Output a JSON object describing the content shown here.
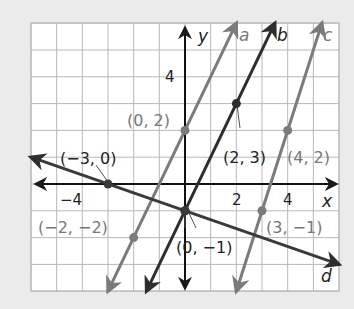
{
  "chart_data": {
    "type": "line",
    "title": "",
    "xlabel": "x",
    "ylabel": "y",
    "xlim": [
      -6,
      6
    ],
    "ylim": [
      -4,
      6
    ],
    "grid": true,
    "x_tick_labels": [
      {
        "value": -4,
        "label": "−4"
      },
      {
        "value": 2,
        "label": "2"
      },
      {
        "value": 4,
        "label": "4"
      }
    ],
    "y_tick_labels": [
      {
        "value": 4,
        "label": "4"
      }
    ],
    "series": [
      {
        "name": "a",
        "color": "#7b7b7b",
        "slope": 2,
        "intercept": 2,
        "from": [
          -3,
          -4
        ],
        "to": [
          2,
          6
        ],
        "points": [
          {
            "x": 0,
            "y": 2,
            "label": "(0, 2)"
          },
          {
            "x": -2,
            "y": -2,
            "label": "(−2, −2)"
          }
        ]
      },
      {
        "name": "b",
        "color": "#2e2e2e",
        "slope": 2,
        "intercept": -1,
        "from": [
          -1.5,
          -4
        ],
        "to": [
          3.5,
          6
        ],
        "points": [
          {
            "x": 2,
            "y": 3,
            "label": "(2, 3)"
          },
          {
            "x": 0,
            "y": -1,
            "label": "(0, −1)"
          }
        ]
      },
      {
        "name": "c",
        "color": "#7b7b7b",
        "slope": 3,
        "intercept": -10,
        "from": [
          2,
          -4
        ],
        "to": [
          5.333,
          6
        ],
        "points": [
          {
            "x": 4,
            "y": 2,
            "label": "(4, 2)"
          },
          {
            "x": 3,
            "y": -1,
            "label": "(3, −1)"
          }
        ]
      },
      {
        "name": "d",
        "color": "#3a3a3a",
        "slope": -0.3333,
        "intercept": -1,
        "from": [
          -6,
          1
        ],
        "to": [
          6,
          -3
        ],
        "points": [
          {
            "x": -3,
            "y": 0,
            "label": "(−3, 0)"
          },
          {
            "x": 0,
            "y": -1,
            "label": "(0, −1)"
          }
        ]
      }
    ]
  },
  "labels": {
    "x_axis": "x",
    "y_axis": "y",
    "line_a": "a",
    "line_b": "b",
    "line_c": "c",
    "line_d": "d",
    "tick_x_neg4": "−4",
    "tick_x_2": "2",
    "tick_x_4": "4",
    "tick_y_4": "4",
    "pt_0_2": "(0, 2)",
    "pt_neg3_0": "(−3, 0)",
    "pt_2_3": "(2, 3)",
    "pt_4_2": "(4, 2)",
    "pt_neg2_neg2": "(−2, −2)",
    "pt_3_neg1": "(3, −1)",
    "pt_0_neg1": "(0, −1)"
  },
  "colors": {
    "background": "#ebebeb",
    "grid_fill": "#ffffff",
    "grid_line": "#b5b5b5",
    "axis": "#111111",
    "gray_line": "#7b7b7b",
    "dark_line": "#2e2e2e",
    "gray_text": "#777777",
    "dark_text": "#222222"
  }
}
